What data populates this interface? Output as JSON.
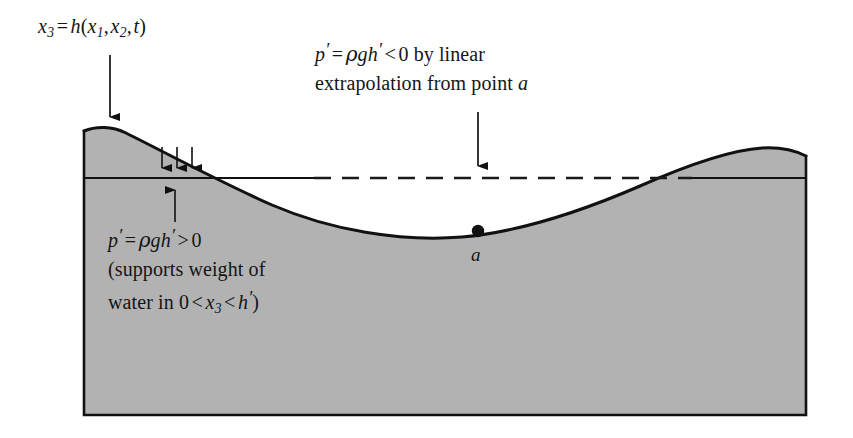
{
  "figure": {
    "title_label": "x_3 = h(x_1, x_2, t)",
    "surface_label": {
      "lhs_var": "x",
      "lhs_sub": "3",
      "eq": "=",
      "func": "h",
      "open": "(",
      "arg1_var": "x",
      "arg1_sub": "1",
      "comma1": ",",
      "arg2_var": "x",
      "arg2_sub": "2",
      "comma2": ",",
      "arg3_var": "t",
      "close": ")"
    },
    "negative_pressure_label": {
      "p": "p",
      "prime": "′",
      "eq": "=",
      "rho": "ρ",
      "g": "g",
      "h": "h",
      "h_prime": "′",
      "lt": "<",
      "zero": "0",
      "line1_tail": "by linear",
      "line2": "extrapolation from point",
      "point": "a"
    },
    "positive_pressure_label": {
      "p": "p",
      "prime": "′",
      "eq": "=",
      "rho": "ρ",
      "g": "g",
      "h": "h",
      "h_prime": "′",
      "gt": ">",
      "zero": "0",
      "line2": "(supports weight of",
      "line3_pre": "water in",
      "line3_zero": "0",
      "line3_lt1": "<",
      "line3_x": "x",
      "line3_x_sub": "3",
      "line3_lt2": "<",
      "line3_h": "h",
      "line3_h_prime": "′",
      "line3_close": ")"
    },
    "point_a_label": "a",
    "colors": {
      "water_fill": "#b2b2b2",
      "outline": "#111111",
      "text": "#151515",
      "dashed_line": "#1a1a1a",
      "background": "#ffffff"
    },
    "geometry": {
      "left_edge_x": 84,
      "right_edge_x": 808,
      "bottom_y": 415,
      "mean_level_y": 178,
      "trough_x": 478,
      "trough_y": 230,
      "crest_left_x": 120,
      "crest_left_y": 131,
      "crest_right_x": 765,
      "crest_right_y": 150,
      "dashed_x_start": 315,
      "dashed_x_end": 690
    },
    "arrows": {
      "surface_pointer": {
        "x": 110,
        "y1": 55,
        "y2": 127,
        "direction": "down"
      },
      "extrapolation_pointer": {
        "x": 478,
        "y1": 112,
        "y2": 176,
        "direction": "down"
      },
      "down_pressure": [
        {
          "x": 162,
          "y1": 147,
          "y2": 177
        },
        {
          "x": 177,
          "y1": 147,
          "y2": 177
        },
        {
          "x": 192,
          "y1": 147,
          "y2": 177
        }
      ],
      "up_pressure": {
        "x": 175,
        "y1": 222,
        "y2": 180,
        "direction": "up"
      }
    }
  }
}
